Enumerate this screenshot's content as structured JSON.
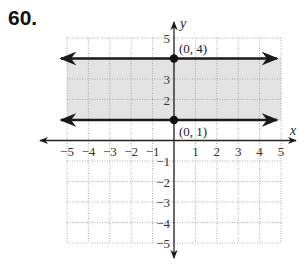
{
  "problem_number": "60.",
  "chart_data": {
    "type": "line",
    "title": "",
    "xlabel": "x",
    "ylabel": "y",
    "xlim": [
      -5,
      5
    ],
    "ylim": [
      -5,
      5
    ],
    "grid": true,
    "x_ticks": [
      "-5",
      "-4",
      "-3",
      "-2",
      "-1",
      "1",
      "2",
      "3",
      "4",
      "5"
    ],
    "y_ticks": [
      "5",
      "3",
      "2",
      "-1",
      "-2",
      "-3",
      "-4",
      "-5"
    ],
    "series": [
      {
        "name": "y = 4",
        "type": "horizontal_line",
        "y": 4,
        "style": "solid",
        "arrows": "both"
      },
      {
        "name": "y = 1",
        "type": "horizontal_line",
        "y": 1,
        "style": "solid",
        "arrows": "both"
      }
    ],
    "shaded_region": {
      "y_from": 1,
      "y_to": 4,
      "color": "#e3e3e3"
    },
    "points": [
      {
        "x": 0,
        "y": 4,
        "label": "(0, 4)"
      },
      {
        "x": 0,
        "y": 1,
        "label": "(0, 1)"
      }
    ]
  }
}
